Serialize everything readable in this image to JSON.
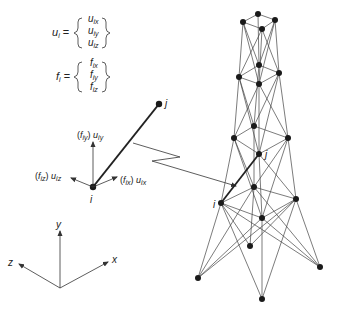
{
  "figure": {
    "type": "space truss finite element diagram",
    "colors": {
      "line": "#333333",
      "node": "#1a1a1a",
      "background": "#ffffff"
    }
  },
  "equations": {
    "displacement": {
      "lhs": "u",
      "lhs_sub": "i",
      "entries": [
        {
          "base": "u",
          "sub": "ix"
        },
        {
          "base": "u",
          "sub": "iy"
        },
        {
          "base": "u",
          "sub": "iz"
        }
      ]
    },
    "force": {
      "lhs": "f",
      "lhs_sub": "i",
      "entries": [
        {
          "base": "f",
          "sub": "ix"
        },
        {
          "base": "f",
          "sub": "iy"
        },
        {
          "base": "f",
          "sub": "iz"
        }
      ]
    }
  },
  "element_detail": {
    "node_i_label": "i",
    "node_j_label": "j",
    "dof_labels": {
      "y": {
        "f": "f",
        "f_sub": "iy",
        "u": "u",
        "u_sub": "iy"
      },
      "z": {
        "f": "f",
        "f_sub": "iz",
        "u": "u",
        "u_sub": "iz"
      },
      "x": {
        "f": "f",
        "f_sub": "ix",
        "u": "u",
        "u_sub": "ix"
      }
    }
  },
  "axes": {
    "x": "x",
    "y": "y",
    "z": "z"
  },
  "tower": {
    "node_i_label": "i",
    "node_j_label": "j",
    "levels": 5,
    "nodes_per_level": 4
  }
}
